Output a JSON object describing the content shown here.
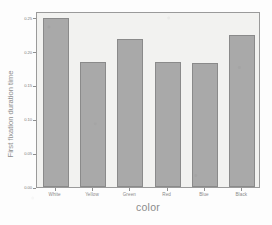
{
  "chart_data": {
    "type": "bar",
    "title": "",
    "xlabel": "color",
    "ylabel": "First fixation duration time",
    "categories": [
      "White",
      "Yellow",
      "Green",
      "Red",
      "Blue",
      "Black"
    ],
    "values": [
      0.25,
      0.184,
      0.219,
      0.184,
      0.183,
      0.225
    ],
    "ylim": [
      0.0,
      0.26
    ],
    "yticks": [
      0.0,
      0.05,
      0.1,
      0.15,
      0.2,
      0.25
    ],
    "ytick_labels": [
      "0.00",
      "0.05",
      "0.10",
      "0.15",
      "0.20",
      "0.25"
    ],
    "grid": false,
    "legend": null,
    "bar_color": "#a9a9a9",
    "bar_edge_color": "#8a8a8a",
    "plot_background": "#f2f2f0",
    "axis_color": "#9a9a9a",
    "text_color": "#8a8a8a"
  }
}
